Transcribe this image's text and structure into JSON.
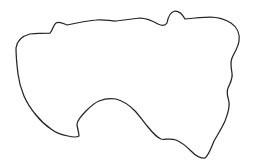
{
  "figure": {
    "kind": "closed-outline-contour",
    "canvas": {
      "width": 254,
      "height": 165,
      "background_color": "#ffffff"
    },
    "stroke": {
      "color": "#242424",
      "width": 1.25,
      "style": "solid",
      "linecap": "round",
      "linejoin": "round"
    },
    "fill": {
      "color": "none",
      "filled": false
    },
    "geometry": {
      "closed": true,
      "bounding_box": {
        "x_min": 16,
        "y_min": 11,
        "x_max": 240,
        "y_max": 159
      },
      "extreme_points": {
        "leftmost": [
          16,
          48
        ],
        "rightmost": [
          240,
          70
        ],
        "topmost": [
          168,
          11
        ],
        "bottommost": [
          206,
          159
        ]
      },
      "features": [
        {
          "name": "top-center-v-notch",
          "apex": [
            140,
            63
          ]
        },
        {
          "name": "upper-left-step-notch",
          "apex": [
            52,
            35
          ]
        },
        {
          "name": "bottom-center-v-notch",
          "apex": [
            78,
            136
          ]
        },
        {
          "name": "right-edge-waves",
          "apex": [
            228,
            96
          ]
        },
        {
          "name": "lower-left-lobe",
          "apex": [
            55,
            120
          ]
        },
        {
          "name": "lower-right-lobe",
          "apex": [
            205,
            158
          ]
        }
      ],
      "path_d": "M 16 48 C 17 41 22 36 30 34 C 38 33 45 33 50 33 C 53 30 53 25 56 23 C 60 21 64 24 67 25 C 76 23 85 21 96 20 C 104 19 110 21 116 21 C 124 20 132 19 140 18 C 148 18 153 21 158 24 C 162 26 165 26 167 23 C 168 17 170 12 175 11 C 180 11 183 15 185 19 C 193 18 202 17 210 17 C 218 17 225 19 231 23 C 237 27 240 34 239 41 C 238 48 234 53 232 58 C 230 63 231 68 232 73 C 233 79 230 83 228 88 C 226 93 228 97 229 102 C 230 109 227 115 225 121 C 222 128 218 134 214 141 C 211 148 209 155 205 158 C 200 159 195 155 191 151 C 186 146 181 142 176 140 C 170 138 165 140 161 139 C 156 137 152 132 148 127 C 143 121 139 115 134 110 C 129 105 123 101 116 99 C 110 98 104 99 99 101 C 94 103 90 107 86 111 C 82 115 78 119 77 124 C 77 128 79 132 79 136 C 76 138 72 137 68 136 C 62 135 56 133 51 129 C 45 125 40 120 36 115 C 31 109 27 103 24 96 C 21 89 19 82 18 74 C 17 66 16 57 16 48 Z"
    }
  }
}
